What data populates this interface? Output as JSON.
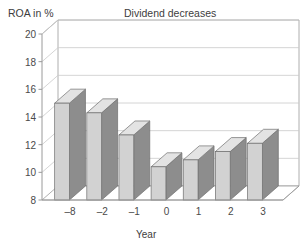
{
  "chart_data": {
    "type": "bar",
    "title": "Dividend decreases",
    "xlabel": "Year",
    "ylabel": "ROA in %",
    "categories": [
      "–8",
      "–2",
      "–1",
      "0",
      "1",
      "2",
      "3"
    ],
    "values": [
      15.0,
      14.3,
      12.7,
      10.4,
      10.9,
      11.5,
      12.1
    ],
    "ylim": [
      8,
      20
    ],
    "yticks": [
      20,
      18,
      16,
      14,
      12,
      10,
      8
    ],
    "grid": true,
    "legend": false,
    "style": "3d-column",
    "colors": {
      "bar_front": "#d2d2d2",
      "bar_side": "#8d8d8d",
      "bar_top": "#e3e3e3",
      "bar_edge": "#6f6f6f",
      "grid": "#c9c9c9",
      "axis": "#9a9a9a",
      "text": "#4a4a4a",
      "background": "#ffffff"
    }
  }
}
